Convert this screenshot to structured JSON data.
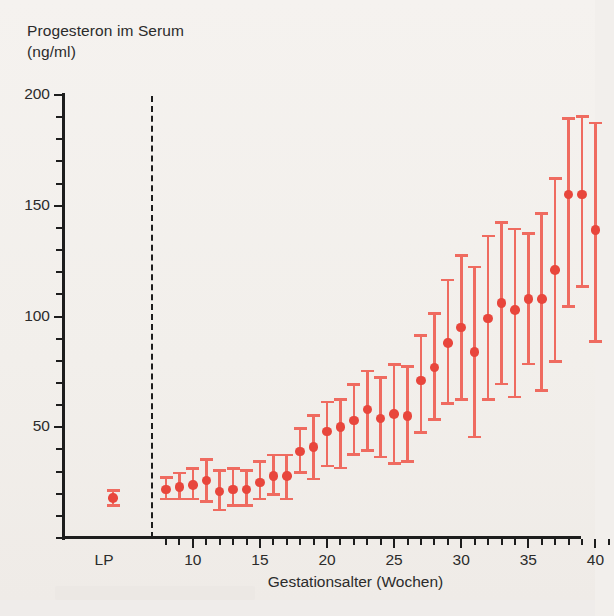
{
  "chart_data": {
    "type": "scatter",
    "title": "Progesteron im Serum (ng/ml)",
    "title_line1": "Progesteron im Serum",
    "title_line2": "(ng/ml)",
    "ylabel": "Progesteron im Serum (ng/ml)",
    "xlabel": "Gestationsalter (Wochen)",
    "ylim": [
      0,
      200
    ],
    "xlim": [
      7,
      42
    ],
    "grid": false,
    "legend": null,
    "y_ticks_major": [
      50,
      100,
      150,
      200
    ],
    "y_tick_labels": [
      "50",
      "100",
      "150",
      "200"
    ],
    "y_tick_minor_step": 10,
    "x_ticks_major": [
      10,
      15,
      20,
      25,
      30,
      35,
      40
    ],
    "x_tick_labels": [
      "10",
      "15",
      "20",
      "25",
      "30",
      "35",
      "40"
    ],
    "x_tick_minor_step": 1,
    "special_category_label": "LP",
    "marker_color": "#e8463c",
    "errorbar_color": "#ef6b60",
    "axis_color": "#1d1d1d",
    "separator": {
      "style": "dashed",
      "after_category": "LP"
    },
    "series": [
      {
        "name": "Progesteron (Median mit Streubereich)",
        "points": [
          {
            "x": "LP",
            "week": null,
            "y": 18,
            "low": 14,
            "high": 22
          },
          {
            "x": "8",
            "week": 8,
            "y": 22,
            "low": 17,
            "high": 28
          },
          {
            "x": "9",
            "week": 9,
            "y": 23,
            "low": 17,
            "high": 30
          },
          {
            "x": "10",
            "week": 10,
            "y": 24,
            "low": 17,
            "high": 32
          },
          {
            "x": "11",
            "week": 11,
            "y": 26,
            "low": 16,
            "high": 36
          },
          {
            "x": "12",
            "week": 12,
            "y": 21,
            "low": 12,
            "high": 31
          },
          {
            "x": "13",
            "week": 13,
            "y": 22,
            "low": 14,
            "high": 32
          },
          {
            "x": "14",
            "week": 14,
            "y": 22,
            "low": 14,
            "high": 31
          },
          {
            "x": "15",
            "week": 15,
            "y": 25,
            "low": 17,
            "high": 35
          },
          {
            "x": "16",
            "week": 16,
            "y": 28,
            "low": 19,
            "high": 38
          },
          {
            "x": "17",
            "week": 17,
            "y": 28,
            "low": 17,
            "high": 38
          },
          {
            "x": "18",
            "week": 18,
            "y": 39,
            "low": 29,
            "high": 50
          },
          {
            "x": "19",
            "week": 19,
            "y": 41,
            "low": 26,
            "high": 56
          },
          {
            "x": "20",
            "week": 20,
            "y": 48,
            "low": 32,
            "high": 62
          },
          {
            "x": "21",
            "week": 21,
            "y": 50,
            "low": 31,
            "high": 63
          },
          {
            "x": "22",
            "week": 22,
            "y": 53,
            "low": 37,
            "high": 70
          },
          {
            "x": "23",
            "week": 23,
            "y": 58,
            "low": 39,
            "high": 76
          },
          {
            "x": "24",
            "week": 24,
            "y": 54,
            "low": 36,
            "high": 73
          },
          {
            "x": "25",
            "week": 25,
            "y": 56,
            "low": 33,
            "high": 79
          },
          {
            "x": "26",
            "week": 26,
            "y": 55,
            "low": 34,
            "high": 78
          },
          {
            "x": "27",
            "week": 27,
            "y": 71,
            "low": 47,
            "high": 92
          },
          {
            "x": "28",
            "week": 28,
            "y": 77,
            "low": 53,
            "high": 102
          },
          {
            "x": "29",
            "week": 29,
            "y": 88,
            "low": 60,
            "high": 117
          },
          {
            "x": "30",
            "week": 30,
            "y": 95,
            "low": 62,
            "high": 128
          },
          {
            "x": "31",
            "week": 31,
            "y": 84,
            "low": 45,
            "high": 123
          },
          {
            "x": "32",
            "week": 32,
            "y": 99,
            "low": 62,
            "high": 137
          },
          {
            "x": "33",
            "week": 33,
            "y": 106,
            "low": 69,
            "high": 143
          },
          {
            "x": "34",
            "week": 34,
            "y": 103,
            "low": 63,
            "high": 140
          },
          {
            "x": "35",
            "week": 35,
            "y": 108,
            "low": 78,
            "high": 138
          },
          {
            "x": "36",
            "week": 36,
            "y": 108,
            "low": 66,
            "high": 147
          },
          {
            "x": "37",
            "week": 37,
            "y": 121,
            "low": 79,
            "high": 163
          },
          {
            "x": "38",
            "week": 38,
            "y": 155,
            "low": 104,
            "high": 190
          },
          {
            "x": "39",
            "week": 39,
            "y": 155,
            "low": 113,
            "high": 191
          },
          {
            "x": "40",
            "week": 40,
            "y": 139,
            "low": 88,
            "high": 188
          }
        ]
      }
    ]
  }
}
